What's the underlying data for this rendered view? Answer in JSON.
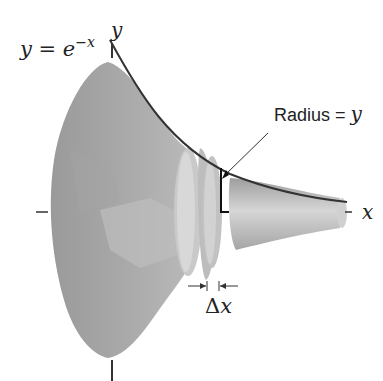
{
  "diagram": {
    "curve_label": {
      "lhs": "y = e",
      "exponent": "−x"
    },
    "axis_labels": {
      "y": "y",
      "x": "x"
    },
    "radius_label": {
      "text": "Radius = ",
      "var": "y"
    },
    "thickness_label": {
      "delta": "Δ",
      "var": "x"
    },
    "colors": {
      "solid_dark": "#8f8f8f",
      "solid_mid": "#a8a8a8",
      "solid_light": "#c8c8c8",
      "disk_light": "#cfcfcf",
      "outline": "#333333",
      "background": "#ffffff"
    }
  }
}
